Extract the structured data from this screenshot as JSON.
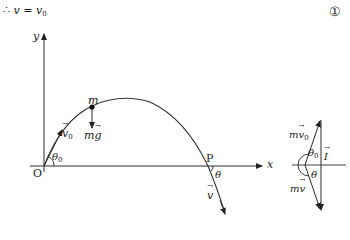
{
  "equation": {
    "therefore_symbol": "∴",
    "lhs": "v",
    "equals": "=",
    "rhs_var": "v",
    "rhs_sub": "0",
    "number_label": "①"
  },
  "trajectory_diagram": {
    "axes": {
      "x_label": "x",
      "y_label": "y",
      "origin_label": "O"
    },
    "initial_velocity": {
      "symbol": "v",
      "sub": "0",
      "angle_symbol": "θ",
      "angle_sub": "0"
    },
    "particle": {
      "mass_label": "m",
      "force_label_m": "m",
      "force_label_g": "g"
    },
    "point_P": {
      "label": "P",
      "angle_symbol": "θ",
      "velocity_symbol": "v"
    }
  },
  "impulse_triangle": {
    "initial_momentum_m": "m",
    "initial_momentum_v": "v",
    "initial_momentum_sub": "0",
    "final_momentum_m": "m",
    "final_momentum_v": "v",
    "impulse_symbol": "I",
    "angle_top_symbol": "θ",
    "angle_top_sub": "0",
    "angle_bottom_symbol": "θ"
  },
  "colors": {
    "stroke": "#2a2a2a",
    "curve": "#333333"
  }
}
